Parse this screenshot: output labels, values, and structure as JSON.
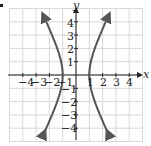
{
  "chart_data": {
    "type": "line",
    "title": "",
    "xlabel": "x",
    "ylabel": "y",
    "xlim": [
      -5,
      5
    ],
    "ylim": [
      -5,
      5
    ],
    "grid": true,
    "x_ticks": [
      -4,
      -3,
      -2,
      -1,
      1,
      2,
      3,
      4
    ],
    "y_ticks": [
      -4,
      -3,
      -2,
      -1,
      1,
      2,
      3,
      4
    ],
    "equation": "x^2 - y^2/4 = 1",
    "series": [
      {
        "name": "right branch",
        "points": [
          [
            2.4,
            -4.4
          ],
          [
            1.8,
            -3
          ],
          [
            1.41,
            -2
          ],
          [
            1.12,
            -1
          ],
          [
            1,
            0
          ],
          [
            1.12,
            1
          ],
          [
            1.41,
            2
          ],
          [
            1.8,
            3
          ],
          [
            2.4,
            4.4
          ]
        ]
      },
      {
        "name": "left branch",
        "points": [
          [
            -2.4,
            -4.4
          ],
          [
            -1.8,
            -3
          ],
          [
            -1.41,
            -2
          ],
          [
            -1.12,
            -1
          ],
          [
            -1,
            0
          ],
          [
            -1.12,
            1
          ],
          [
            -1.41,
            2
          ],
          [
            -1.8,
            3
          ],
          [
            -2.4,
            4.4
          ]
        ]
      }
    ],
    "colors": {
      "curve": "#555555",
      "grid": "#d8d8d8",
      "axis": "#222222"
    }
  },
  "labels": {
    "x_axis": "x",
    "y_axis": "y",
    "x_ticks": [
      "−4",
      "−3",
      "−2",
      "−1",
      "1",
      "2",
      "3",
      "4"
    ],
    "y_ticks": [
      "4",
      "3",
      "2",
      "1",
      "−1",
      "−2",
      "−3",
      "−4"
    ]
  }
}
